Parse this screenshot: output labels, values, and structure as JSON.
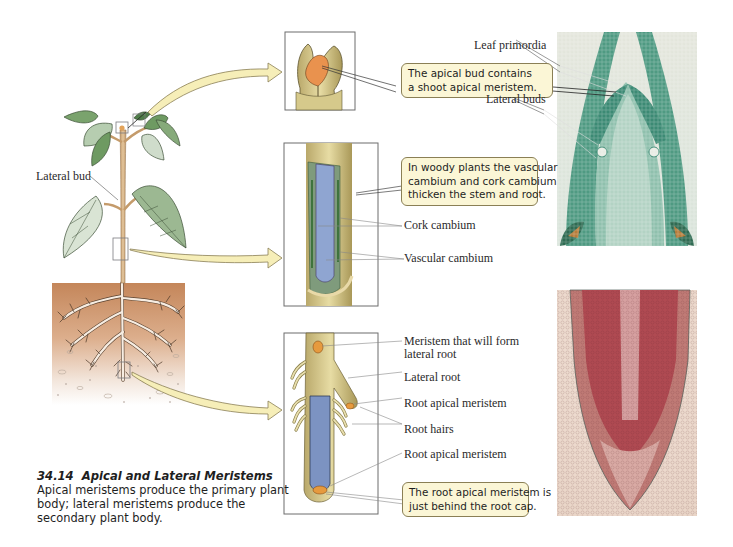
{
  "figure": {
    "number": "34.14",
    "title": "Apical and Lateral Meristems",
    "description": "Apical meristems produce the primary plant body; lateral meristems produce the secondary plant body."
  },
  "plant": {
    "label_lateral_bud": "Lateral bud"
  },
  "shoot_panel": {
    "callout": [
      "The apical bud contains",
      "a shoot apical meristem."
    ],
    "photo_labels": {
      "leaf_primordia": "Leaf primordia",
      "lateral_buds": "Lateral buds"
    }
  },
  "stem_panel": {
    "callout": [
      "In woody plants the vascular",
      "cambium and cork cambium",
      "thicken the stem and root."
    ],
    "labels": {
      "cork_cambium": "Cork cambium",
      "vascular_cambium": "Vascular cambium"
    }
  },
  "root_panel": {
    "labels": {
      "meristem_lateral_root": [
        "Meristem that will form",
        "lateral root"
      ],
      "lateral_root": "Lateral root",
      "root_apical_meristem_1": "Root apical meristem",
      "root_hairs": "Root hairs",
      "root_apical_meristem_2": "Root apical meristem"
    },
    "callout": [
      "The root apical meristem is",
      "just behind the root cap."
    ]
  },
  "colors": {
    "arrow_fill": "#f6eeb8",
    "arrow_stroke": "#8a7f55",
    "callout_fill": "#fbf6d6",
    "stem_tan": "#d8b98e",
    "leaf_green": "#6f9a68",
    "soil_brown": "#c88a5c",
    "photo_shoot_green": "#3f8f78",
    "photo_root_red": "#b65a5c",
    "vascular_blue": "#7c93c2",
    "meristem_orange": "#e69a3e"
  }
}
